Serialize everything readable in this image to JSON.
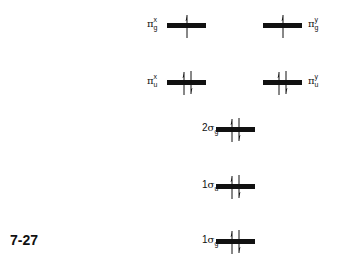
{
  "figure": {
    "number": "7-27",
    "type": "molecular orbital energy level diagram"
  },
  "levels": [
    {
      "id": "pi_g_x",
      "prefix": "",
      "greek": "π",
      "sub": "g",
      "sup": "x",
      "electrons": "up",
      "label_side": "left"
    },
    {
      "id": "pi_g_y",
      "prefix": "",
      "greek": "π",
      "sub": "g",
      "sup": "y",
      "electrons": "up",
      "label_side": "right"
    },
    {
      "id": "pi_u_x",
      "prefix": "",
      "greek": "π",
      "sub": "u",
      "sup": "x",
      "electrons": "up-down",
      "label_side": "left"
    },
    {
      "id": "pi_u_y",
      "prefix": "",
      "greek": "π",
      "sub": "u",
      "sup": "y",
      "electrons": "up-down",
      "label_side": "right"
    },
    {
      "id": "2sigma_g",
      "prefix": "2",
      "greek": "σ",
      "sub": "g",
      "sup": "",
      "electrons": "up-down",
      "label_side": "left"
    },
    {
      "id": "1sigma_u",
      "prefix": "1",
      "greek": "σ",
      "sub": "u",
      "sup": "",
      "electrons": "up-down",
      "label_side": "left"
    },
    {
      "id": "1sigma_g",
      "prefix": "1",
      "greek": "σ",
      "sub": "g",
      "sup": "",
      "electrons": "up-down",
      "label_side": "left"
    }
  ]
}
